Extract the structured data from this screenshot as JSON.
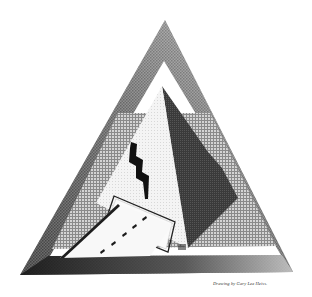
{
  "artwork": {
    "subject": "pyramid inside triangular frame with lightning bolt and road",
    "caption": "Drawing by Gary Lee Heiss.",
    "colors": {
      "background": "#ffffff",
      "outer_frame_dark": "#2a2a2a",
      "outer_frame_light": "#9a9a9a",
      "crosshatch": "#bdbdbd",
      "pyramid_lit_face": "#f1f1f1",
      "pyramid_shadow_face": "#3c3c3c",
      "lightning": "#111111",
      "road": "#f7f7f7",
      "road_dashes": "#1a1a1a"
    }
  }
}
